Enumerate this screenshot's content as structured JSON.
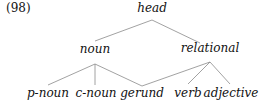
{
  "example_number": "(98)",
  "tree": {
    "root": {
      "label": "head",
      "x": 152,
      "y": 1
    },
    "level1": [
      {
        "label": "noun",
        "x": 95,
        "y": 42
      },
      {
        "label": "relational",
        "x": 210,
        "y": 41
      }
    ],
    "level2": [
      {
        "label": "p-noun",
        "x": 48,
        "y": 86
      },
      {
        "label": "c-noun",
        "x": 96,
        "y": 86
      },
      {
        "label": "gerund",
        "x": 142,
        "y": 86
      },
      {
        "label": "verb",
        "x": 188,
        "y": 86
      },
      {
        "label": "adjective",
        "x": 231,
        "y": 86
      }
    ],
    "edges": [
      [
        "head",
        "noun"
      ],
      [
        "head",
        "relational"
      ],
      [
        "noun",
        "p-noun"
      ],
      [
        "noun",
        "c-noun"
      ],
      [
        "noun",
        "gerund"
      ],
      [
        "relational",
        "gerund"
      ],
      [
        "relational",
        "verb"
      ],
      [
        "relational",
        "adjective"
      ]
    ],
    "line_color": "#888888"
  }
}
